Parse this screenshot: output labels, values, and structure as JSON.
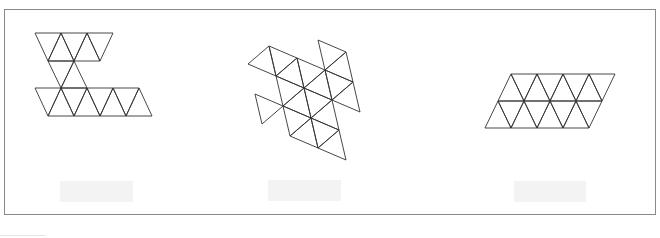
{
  "figure": {
    "stroke_color": "#333333",
    "frame_color": "#8a8a8a",
    "placeholder_color": "#f3f3f3"
  },
  "nets": [
    {
      "id": "net-a",
      "label": "",
      "description": "Z-shaped net of equilateral triangles: row of 5 top, 2 middle connectors, row of 9 bottom",
      "triangles": [
        [
          [
            35,
            33
          ],
          [
            61,
            33
          ],
          [
            48,
            61
          ]
        ],
        [
          [
            61,
            33
          ],
          [
            48,
            61
          ],
          [
            74,
            61
          ]
        ],
        [
          [
            61,
            33
          ],
          [
            87,
            33
          ],
          [
            74,
            61
          ]
        ],
        [
          [
            87,
            33
          ],
          [
            74,
            61
          ],
          [
            100,
            61
          ]
        ],
        [
          [
            87,
            33
          ],
          [
            113,
            33
          ],
          [
            100,
            61
          ]
        ],
        [
          [
            48,
            61
          ],
          [
            74,
            61
          ],
          [
            61,
            88
          ]
        ],
        [
          [
            74,
            61
          ],
          [
            61,
            88
          ],
          [
            87,
            88
          ]
        ],
        [
          [
            35,
            88
          ],
          [
            61,
            88
          ],
          [
            48,
            116
          ]
        ],
        [
          [
            61,
            88
          ],
          [
            48,
            116
          ],
          [
            74,
            116
          ]
        ],
        [
          [
            61,
            88
          ],
          [
            87,
            88
          ],
          [
            74,
            116
          ]
        ],
        [
          [
            87,
            88
          ],
          [
            74,
            116
          ],
          [
            100,
            116
          ]
        ],
        [
          [
            87,
            88
          ],
          [
            113,
            88
          ],
          [
            100,
            116
          ]
        ],
        [
          [
            113,
            88
          ],
          [
            100,
            116
          ],
          [
            126,
            116
          ]
        ],
        [
          [
            113,
            88
          ],
          [
            139,
            88
          ],
          [
            126,
            116
          ]
        ],
        [
          [
            139,
            88
          ],
          [
            126,
            116
          ],
          [
            152,
            116
          ]
        ]
      ]
    },
    {
      "id": "net-b",
      "label": "",
      "description": "Rotated irregular net of equilateral triangles",
      "triangles": [
        [
          [
            248,
            64
          ],
          [
            269,
            46
          ],
          [
            276,
            76
          ]
        ],
        [
          [
            269,
            46
          ],
          [
            297,
            58
          ],
          [
            276,
            76
          ]
        ],
        [
          [
            297,
            58
          ],
          [
            304,
            88
          ],
          [
            276,
            76
          ]
        ],
        [
          [
            297,
            58
          ],
          [
            325,
            70
          ],
          [
            304,
            88
          ]
        ],
        [
          [
            325,
            70
          ],
          [
            332,
            100
          ],
          [
            304,
            88
          ]
        ],
        [
          [
            318,
            40
          ],
          [
            346,
            52
          ],
          [
            325,
            70
          ]
        ],
        [
          [
            346,
            52
          ],
          [
            353,
            82
          ],
          [
            325,
            70
          ]
        ],
        [
          [
            325,
            70
          ],
          [
            353,
            82
          ],
          [
            332,
            100
          ]
        ],
        [
          [
            353,
            82
          ],
          [
            360,
            112
          ],
          [
            332,
            100
          ]
        ],
        [
          [
            276,
            76
          ],
          [
            304,
            88
          ],
          [
            283,
            106
          ]
        ],
        [
          [
            304,
            88
          ],
          [
            311,
            118
          ],
          [
            283,
            106
          ]
        ],
        [
          [
            304,
            88
          ],
          [
            332,
            100
          ],
          [
            311,
            118
          ]
        ],
        [
          [
            332,
            100
          ],
          [
            339,
            130
          ],
          [
            311,
            118
          ]
        ],
        [
          [
            255,
            94
          ],
          [
            283,
            106
          ],
          [
            262,
            124
          ]
        ],
        [
          [
            283,
            106
          ],
          [
            311,
            118
          ],
          [
            290,
            136
          ]
        ],
        [
          [
            311,
            118
          ],
          [
            318,
            148
          ],
          [
            290,
            136
          ]
        ],
        [
          [
            311,
            118
          ],
          [
            339,
            130
          ],
          [
            318,
            148
          ]
        ],
        [
          [
            339,
            130
          ],
          [
            346,
            160
          ],
          [
            318,
            148
          ]
        ]
      ]
    },
    {
      "id": "net-c",
      "label": "",
      "description": "Parallelogram of 16 equilateral triangles (2 rows of 8)",
      "triangles": [
        [
          [
            511,
            74
          ],
          [
            537,
            74
          ],
          [
            524,
            101
          ]
        ],
        [
          [
            511,
            74
          ],
          [
            498,
            101
          ],
          [
            524,
            101
          ]
        ],
        [
          [
            537,
            74
          ],
          [
            563,
            74
          ],
          [
            550,
            101
          ]
        ],
        [
          [
            537,
            74
          ],
          [
            524,
            101
          ],
          [
            550,
            101
          ]
        ],
        [
          [
            563,
            74
          ],
          [
            589,
            74
          ],
          [
            576,
            101
          ]
        ],
        [
          [
            563,
            74
          ],
          [
            550,
            101
          ],
          [
            576,
            101
          ]
        ],
        [
          [
            589,
            74
          ],
          [
            615,
            74
          ],
          [
            602,
            101
          ]
        ],
        [
          [
            589,
            74
          ],
          [
            576,
            101
          ],
          [
            602,
            101
          ]
        ],
        [
          [
            498,
            101
          ],
          [
            524,
            101
          ],
          [
            511,
            128
          ]
        ],
        [
          [
            498,
            101
          ],
          [
            485,
            128
          ],
          [
            511,
            128
          ]
        ],
        [
          [
            524,
            101
          ],
          [
            550,
            101
          ],
          [
            537,
            128
          ]
        ],
        [
          [
            524,
            101
          ],
          [
            511,
            128
          ],
          [
            537,
            128
          ]
        ],
        [
          [
            550,
            101
          ],
          [
            576,
            101
          ],
          [
            563,
            128
          ]
        ],
        [
          [
            550,
            101
          ],
          [
            537,
            128
          ],
          [
            563,
            128
          ]
        ],
        [
          [
            576,
            101
          ],
          [
            602,
            101
          ],
          [
            589,
            128
          ]
        ],
        [
          [
            576,
            101
          ],
          [
            563,
            128
          ],
          [
            589,
            128
          ]
        ]
      ]
    }
  ],
  "captions": [
    {
      "text": "",
      "x": 60,
      "y": 181,
      "w": 73
    },
    {
      "text": "",
      "x": 268,
      "y": 180,
      "w": 73
    },
    {
      "text": "",
      "x": 514,
      "y": 181,
      "w": 72
    }
  ]
}
